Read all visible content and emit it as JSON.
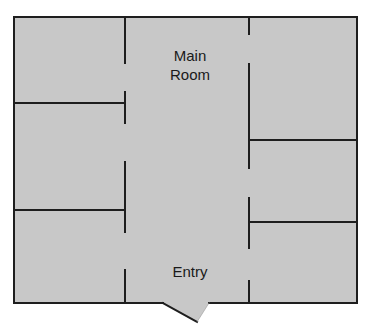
{
  "diagram": {
    "type": "floor-plan",
    "colors": {
      "floor": "#c8c8c8",
      "wall": "#1e1e1e",
      "background": "#ffffff"
    },
    "rooms": [
      {
        "id": "main-room",
        "label_line1": "Main",
        "label_line2": "Room"
      },
      {
        "id": "entry",
        "label": "Entry"
      },
      {
        "id": "left-room-top",
        "label": ""
      },
      {
        "id": "left-room-middle",
        "label": ""
      },
      {
        "id": "left-room-bottom",
        "label": ""
      },
      {
        "id": "right-room-top",
        "label": ""
      },
      {
        "id": "right-room-middle",
        "label": ""
      },
      {
        "id": "right-room-bottom",
        "label": ""
      }
    ],
    "doors": [
      {
        "id": "entry-door",
        "location": "bottom wall, center"
      }
    ]
  }
}
